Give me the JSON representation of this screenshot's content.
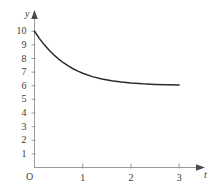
{
  "chart_data": {
    "type": "line",
    "title": "",
    "subtitle": "",
    "xlabel": "t",
    "ylabel": "y",
    "origin_label": "O",
    "grid": false,
    "legend": null,
    "xlim": [
      0,
      3.35
    ],
    "ylim": [
      0,
      10.9
    ],
    "xticks": [
      1,
      2,
      3
    ],
    "xtick_labels": [
      "1",
      "2",
      "3"
    ],
    "yticks": [
      1,
      2,
      3,
      4,
      5,
      6,
      7,
      8,
      9,
      10
    ],
    "ytick_labels": [
      "1",
      "2",
      "3",
      "4",
      "5",
      "6",
      "7",
      "8",
      "9",
      "10"
    ],
    "asymptote": 6,
    "series": [
      {
        "name": "decay-curve",
        "color": "#2b2b2b",
        "x": [
          0.0,
          0.1,
          0.2,
          0.3,
          0.4,
          0.5,
          0.6,
          0.7,
          0.8,
          0.9,
          1.0,
          1.2,
          1.4,
          1.6,
          1.8,
          2.0,
          2.25,
          2.5,
          2.75,
          3.0
        ],
        "y": [
          10.0,
          9.48,
          9.02,
          8.62,
          8.27,
          7.96,
          7.69,
          7.46,
          7.25,
          7.07,
          6.92,
          6.67,
          6.49,
          6.36,
          6.27,
          6.2,
          6.14,
          6.1,
          6.07,
          6.05
        ]
      }
    ],
    "axis_color": "#9a9a9a",
    "curve_color": "#2b2b2b",
    "background": "#ffffff"
  },
  "axes": {
    "y_name": "y",
    "x_name": "t",
    "origin": "O"
  }
}
